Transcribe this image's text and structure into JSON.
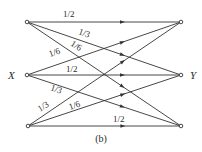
{
  "figure": {
    "caption": "(b)",
    "input_label": "X",
    "output_label": "Y",
    "line_color": "#333333",
    "background": "#ffffff"
  },
  "nodes": {
    "inputs": [
      {
        "id": "x1",
        "x": 27,
        "y": 22
      },
      {
        "id": "x2",
        "x": 27,
        "y": 75
      },
      {
        "id": "x3",
        "x": 28,
        "y": 126
      }
    ],
    "outputs": [
      {
        "id": "y1",
        "x": 181,
        "y": 22
      },
      {
        "id": "y2",
        "x": 181,
        "y": 75
      },
      {
        "id": "y3",
        "x": 181,
        "y": 126
      }
    ]
  },
  "edges": [
    {
      "from": "x1",
      "to": "y1",
      "label": "1/2",
      "lx": 63,
      "ly": 17,
      "rot": 0
    },
    {
      "from": "x1",
      "to": "y2",
      "label": "1/3",
      "lx": 78,
      "ly": 34,
      "rot": 19
    },
    {
      "from": "x1",
      "to": "y3",
      "label": "1/6",
      "lx": 70,
      "ly": 45,
      "rot": 33
    },
    {
      "from": "x2",
      "to": "y1",
      "label": "1/6",
      "lx": 50,
      "ly": 57,
      "rot": -19
    },
    {
      "from": "x2",
      "to": "y2",
      "label": "1/2",
      "lx": 66,
      "ly": 72,
      "rot": 0
    },
    {
      "from": "x2",
      "to": "y3",
      "label": "1/3",
      "lx": 50,
      "ly": 90,
      "rot": 19
    },
    {
      "from": "x3",
      "to": "y1",
      "label": "1/3",
      "lx": 40,
      "ly": 112,
      "rot": -33
    },
    {
      "from": "x3",
      "to": "y2",
      "label": "1/6",
      "lx": 70,
      "ly": 110,
      "rot": -19
    },
    {
      "from": "x3",
      "to": "y3",
      "label": "1/2",
      "lx": 113,
      "ly": 122,
      "rot": 0
    }
  ]
}
